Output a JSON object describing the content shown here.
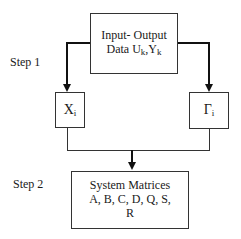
{
  "diagram": {
    "steps": [
      {
        "label": "Step 1"
      },
      {
        "label": "Step 2"
      }
    ],
    "nodes": {
      "input_output": {
        "line1": "Input- Output",
        "line2_prefix": "Data U",
        "sub_u": "k",
        "sep": ",Y",
        "sub_y": "k"
      },
      "x_i": {
        "symbol": "X",
        "sub": "i"
      },
      "gamma_i": {
        "symbol": "Γ",
        "sub": "i"
      },
      "system_matrices": {
        "line1": "System Matrices",
        "line2": "A, B, C, D, Q, S,",
        "line3": "R"
      }
    },
    "edges": [
      {
        "from": "input_output",
        "to": "x_i"
      },
      {
        "from": "input_output",
        "to": "gamma_i"
      },
      {
        "from": "x_i",
        "to": "system_matrices"
      },
      {
        "from": "gamma_i",
        "to": "system_matrices"
      }
    ]
  }
}
